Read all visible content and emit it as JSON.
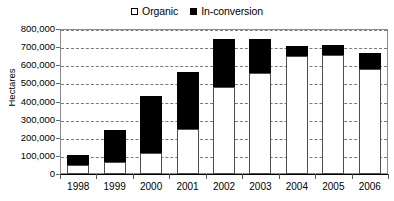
{
  "chart_data": {
    "type": "bar",
    "stacked": true,
    "title": "",
    "subtitle": "",
    "xlabel": "",
    "ylabel": "Hectares",
    "categories": [
      "1998",
      "1999",
      "2000",
      "2001",
      "2002",
      "2003",
      "2004",
      "2005",
      "2006"
    ],
    "series": [
      {
        "name": "Organic",
        "color": "#ffffff",
        "values": [
          50000,
          65000,
          115000,
          250000,
          480000,
          560000,
          650000,
          655000,
          578000
        ]
      },
      {
        "name": "In-conversion",
        "color": "#000000",
        "values": [
          55000,
          180000,
          315000,
          315000,
          265000,
          185000,
          55000,
          55000,
          92000
        ]
      }
    ],
    "totals": [
      105000,
      245000,
      430000,
      565000,
      745000,
      745000,
      705000,
      710000,
      670000
    ],
    "ylim": [
      0,
      800000
    ],
    "ytick_values": [
      0,
      100000,
      200000,
      300000,
      400000,
      500000,
      600000,
      700000,
      800000
    ],
    "ytick_labels": [
      "0",
      "100,000",
      "200,000",
      "300,000",
      "400,000",
      "500,000",
      "600,000",
      "700,000",
      "800,000"
    ],
    "grid": true,
    "grid_axis": "y",
    "grid_style": "dashed",
    "legend_position": "top-center",
    "legend_entries": [
      "Organic",
      "In-conversion"
    ]
  },
  "legend": {
    "organic_label": "Organic",
    "inconversion_label": "In-conversion"
  },
  "axes": {
    "y_title": "Hectares"
  }
}
